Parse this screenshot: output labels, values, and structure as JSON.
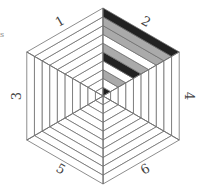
{
  "diagram": {
    "type": "hexagonal-ring-diagram",
    "ring_count": 10,
    "center": [
      103,
      96
    ],
    "radius": 88,
    "colors": {
      "line": "#707070",
      "dark": "#222222",
      "gray": "#aaaaaa",
      "white": "#ffffff"
    },
    "sectors": [
      {
        "label": "1",
        "fills": [
          "white",
          "white",
          "white",
          "white",
          "white",
          "white",
          "white",
          "white",
          "white",
          "white"
        ]
      },
      {
        "label": "2",
        "fills": [
          "dark",
          "white",
          "gray",
          "white",
          "dark",
          "gray",
          "white",
          "gray",
          "gray",
          "dark"
        ]
      },
      {
        "label": "4",
        "fills": [
          "white",
          "white",
          "white",
          "white",
          "white",
          "white",
          "white",
          "white",
          "white",
          "white"
        ]
      },
      {
        "label": "6",
        "fills": [
          "white",
          "white",
          "white",
          "white",
          "white",
          "white",
          "white",
          "white",
          "white",
          "white"
        ]
      },
      {
        "label": "5",
        "fills": [
          "white",
          "white",
          "white",
          "white",
          "white",
          "white",
          "white",
          "white",
          "white",
          "white"
        ]
      },
      {
        "label": "3",
        "fills": [
          "white",
          "white",
          "white",
          "white",
          "white",
          "white",
          "white",
          "white",
          "white",
          "white"
        ]
      }
    ],
    "fragment_text": "s"
  }
}
